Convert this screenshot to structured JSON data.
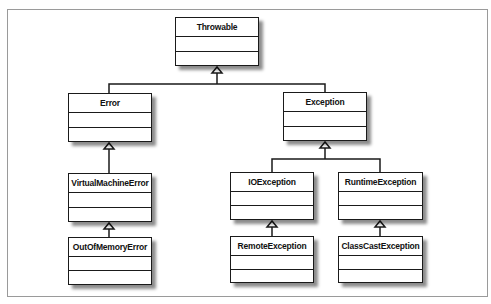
{
  "diagram": {
    "type": "uml-class-hierarchy",
    "classes": {
      "throwable": {
        "name": "Throwable"
      },
      "error": {
        "name": "Error"
      },
      "exception": {
        "name": "Exception"
      },
      "virtual_machine_error": {
        "name": "VirtualMachineError"
      },
      "out_of_memory_error": {
        "name": "OutOfMemoryError"
      },
      "io_exception": {
        "name": "IOException"
      },
      "runtime_exception": {
        "name": "RuntimeException"
      },
      "remote_exception": {
        "name": "RemoteException"
      },
      "class_cast_exception": {
        "name": "ClassCastException"
      }
    },
    "generalizations": [
      {
        "child": "Error",
        "parent": "Throwable"
      },
      {
        "child": "Exception",
        "parent": "Throwable"
      },
      {
        "child": "VirtualMachineError",
        "parent": "Error"
      },
      {
        "child": "OutOfMemoryError",
        "parent": "VirtualMachineError"
      },
      {
        "child": "IOException",
        "parent": "Exception"
      },
      {
        "child": "RuntimeException",
        "parent": "Exception"
      },
      {
        "child": "RemoteException",
        "parent": "IOException"
      },
      {
        "child": "ClassCastException",
        "parent": "RuntimeException"
      }
    ],
    "colors": {
      "line": "#1a1a1a",
      "shadow": "#7a7a7a",
      "frame": "#9a9a9a",
      "background": "#ffffff"
    }
  }
}
